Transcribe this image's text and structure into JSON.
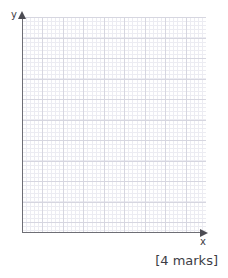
{
  "figure": {
    "kind": "blank-graph-grid",
    "background_color": "#ffffff",
    "axes": {
      "y_axis_label": "y",
      "x_axis_label": "x",
      "axis_color": "#6e6e75",
      "arrow_color": "#4c4c53",
      "y_arrow_icon": "arrow-up-icon",
      "x_arrow_icon": "arrow-right-icon"
    },
    "grid": {
      "minor_line_color": "#ececf2",
      "major_line_color": "#d6d6e0",
      "minor_cells_per_major": 5,
      "minor_cell_px": 4.1,
      "minor_columns": 45,
      "minor_rows": 52,
      "major_columns": 9,
      "major_rows": 10,
      "tick_labels_x": [],
      "tick_labels_y": []
    }
  },
  "footer": {
    "marks_text": "[4 marks]",
    "text_color": "#3d3d44"
  },
  "chart_data": {
    "type": "scatter",
    "title": "",
    "xlabel": "x",
    "ylabel": "y",
    "x": [],
    "values": [],
    "series": [],
    "categories": [],
    "xlim": [
      0,
      45
    ],
    "ylim": [
      0,
      52
    ],
    "grid": true,
    "legend_position": "none",
    "annotations": [
      "[4 marks]"
    ],
    "note": "Empty exam-style graph paper: axes drawn with arrowheads, no plotted data, no tick labels."
  }
}
